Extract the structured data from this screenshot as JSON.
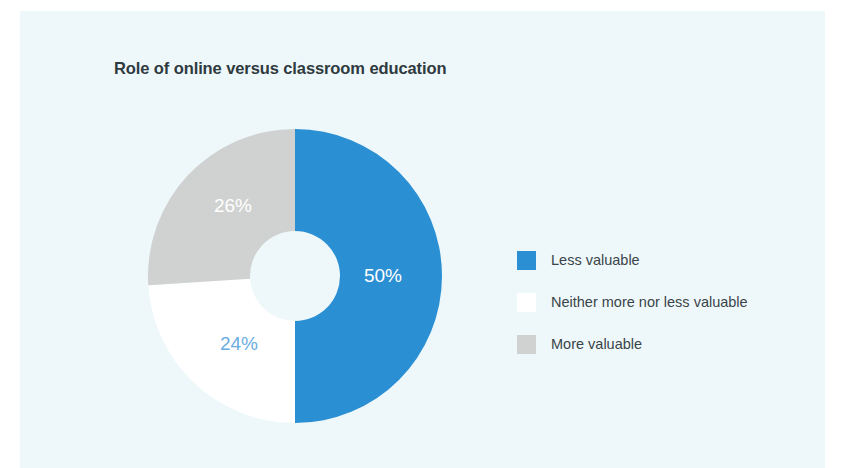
{
  "figure": {
    "background_color": "#eef8fa",
    "page_background_color": "#ffffff"
  },
  "chart_data": {
    "type": "pie",
    "variant": "donut",
    "title": "Role of online versus classroom education",
    "xlabel": "",
    "ylabel": "",
    "legend_position": "right",
    "grid": false,
    "start_angle_deg": 0,
    "direction": "clockwise",
    "categories": [
      "Less valuable",
      "Neither more nor less valuable",
      "More valuable"
    ],
    "values": [
      50,
      24,
      26
    ],
    "value_labels": [
      "50%",
      "24%",
      "26%"
    ],
    "colors": [
      "#2b8fd4",
      "#ffffff",
      "#cfd2d0"
    ],
    "label_colors": [
      "#ffffff",
      "#6aaee0",
      "#ffffff"
    ],
    "slices": [
      {
        "name": "Less valuable",
        "value": 50,
        "label": "50%",
        "color": "#2b8fd4",
        "label_color": "#ffffff",
        "label_x": 363,
        "label_y": 271
      },
      {
        "name": "Neither more nor less valuable",
        "value": 24,
        "label": "24%",
        "color": "#ffffff",
        "label_color": "#6aaee0",
        "label_x": 219,
        "label_y": 339
      },
      {
        "name": "More valuable",
        "value": 26,
        "label": "26%",
        "color": "#cfd2d0",
        "label_color": "#ffffff",
        "label_x": 213,
        "label_y": 201
      }
    ]
  },
  "legend": {
    "items": [
      {
        "label": "Less valuable",
        "color": "#2b8fd4"
      },
      {
        "label": "Neither more nor less valuable",
        "color": "#ffffff"
      },
      {
        "label": "More valuable",
        "color": "#cfd2d0"
      }
    ]
  }
}
